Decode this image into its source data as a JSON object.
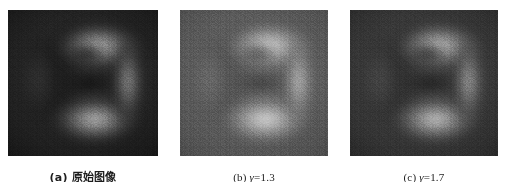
{
  "figure": {
    "name": "gamma-correction-comparison",
    "background_color": "#ffffff",
    "panel_count": 3
  },
  "panels": [
    {
      "id": "panel-a",
      "caption_index": "(a)",
      "caption_text": "(a) 原始图像",
      "label": "原始图像",
      "gamma": null,
      "image_alt": "原始图像",
      "mean_brightness": "dark",
      "colors": {
        "background": "#171717",
        "midtone": "#3a3a3a",
        "highlight": "#b9b9b9",
        "shadow": "#0d0d0d"
      }
    },
    {
      "id": "panel-b",
      "caption_index": "(b)",
      "caption_prefix": "(b) ",
      "caption_symbol": "γ",
      "caption_value": "=1.3",
      "caption_text": "(b) γ=1.3",
      "label": "γ=1.3",
      "gamma": "1.3",
      "image_alt": "伽马校正后图像 γ=1.3",
      "mean_brightness": "bright",
      "colors": {
        "background": "#4e4e4e",
        "midtone": "#777777",
        "highlight": "#dcdcdc",
        "shadow": "#3a3a3a"
      }
    },
    {
      "id": "panel-c",
      "caption_index": "(c)",
      "caption_prefix": "(c) ",
      "caption_symbol": "γ",
      "caption_value": "=1.7",
      "caption_text": "(c) γ=1.7",
      "label": "γ=1.7",
      "gamma": "1.7",
      "image_alt": "伽马校正后图像 γ=1.7",
      "mean_brightness": "medium-dark",
      "colors": {
        "background": "#2a2a2a",
        "midtone": "#525252",
        "highlight": "#c8c8c8",
        "shadow": "#1a1a1a"
      }
    }
  ]
}
